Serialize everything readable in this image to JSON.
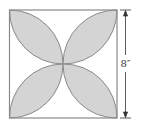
{
  "diagram": {
    "type": "geometry-figure",
    "square": {
      "x": 9.5,
      "y": 10,
      "size": 109
    },
    "dimension": {
      "label": "8″",
      "side": "right"
    },
    "colors": {
      "shade": "#d4d4d4",
      "stroke": "#8a8a8a",
      "dimension_line": "#333333"
    }
  }
}
